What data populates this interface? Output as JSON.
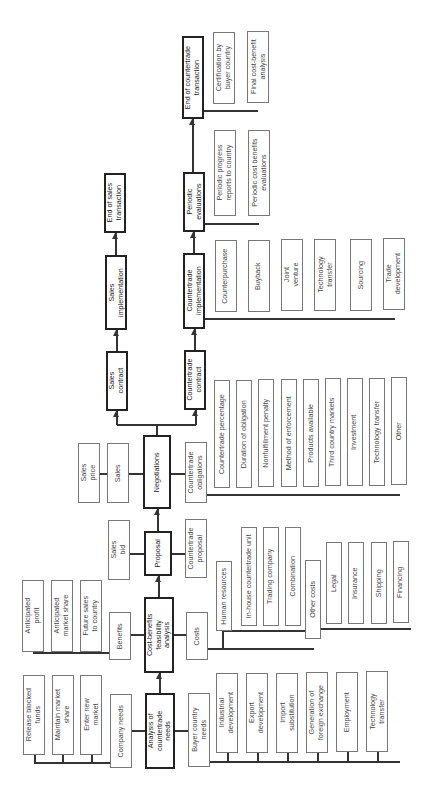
{
  "main_chain": {
    "analysis": "Analysis of\ncountertrade\nneeds",
    "cost_benefit": "Cost-benefits\nfeasibility\nanalysis",
    "proposal": "Proposal",
    "negotiations": "Negotiations",
    "sales_contract": "Sales\ncontract",
    "sales_implementation": "Sales\nimplementation",
    "end_sales": "End of sales\ntransaction",
    "countertrade_contract": "Countertrade\ncontract",
    "countertrade_implementation": "Countertrade\nimplementation",
    "periodic_evaluations": "Periodic\nevaluations",
    "end_countertrade": "End of countertrade\ntransaction"
  },
  "company_needs": {
    "label": "Company needs",
    "items": [
      "Release blocked\nfunds",
      "Maintain market\nshare",
      "Enter new\nmarket"
    ]
  },
  "buyer_country_needs": {
    "label": "Buyer country\nneeds",
    "items": [
      "Industrial\ndevelopment",
      "Export\ndevelopment",
      "Import\nsubstitution",
      "Generation of\nforeign exchange",
      "Employment",
      "Technology\ntransfer"
    ]
  },
  "benefits": {
    "label": "Benefits",
    "items": [
      "Anticipated\nprofit",
      "Anticipated\nmarket share",
      "Future sales\nto country"
    ]
  },
  "costs": {
    "label": "Costs",
    "items": [
      "Human resources",
      "In-house countertrade unit",
      "Trading company",
      "Combination"
    ],
    "other_costs": {
      "label": "Other costs",
      "items": [
        "Legal",
        "Insurance",
        "Shipping",
        "Financing"
      ]
    }
  },
  "proposal_branches": {
    "sales_bid": "Sales\nbid",
    "countertrade_proposal": "Countertrade\nproposal"
  },
  "negotiation_branches": {
    "sales": "Sales",
    "sales_price": "Sales\nprice",
    "countertrade_obligations": {
      "label": "Countertrade\nobligations",
      "items": [
        "Countertrade percentage",
        "Duration of obligation",
        "Nonfulfillment penalty",
        "Method of enforcement",
        "Products available",
        "Third country markets",
        "Investment",
        "Technology transfer",
        "Other"
      ]
    }
  },
  "implementation_types": [
    "Counterpurchase",
    "Buyback",
    "Joint\nventure",
    "Technology\ntransfer",
    "Sourcing",
    "Trade\ndevelopment"
  ],
  "evaluations": [
    "Periodic progress\nreports to country",
    "Periodic cost benefits\nevaluations"
  ],
  "end_items": [
    "Certification by\nbuyer country",
    "Final cost-benefit\nanalysis"
  ]
}
